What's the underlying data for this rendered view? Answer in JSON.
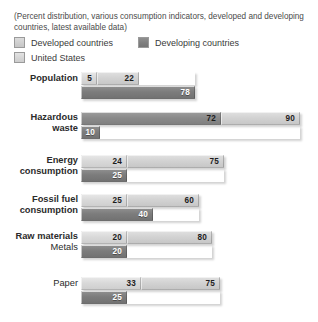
{
  "caption": "(Percent distribution, various consumption indicators, developed and developing countries, latest available data)",
  "legend": {
    "items": [
      {
        "label": "Developed countries",
        "swatch": "light-gray-swatch"
      },
      {
        "label": "Developing countries",
        "swatch": "dark-gray-swatch"
      },
      {
        "label": "United States",
        "swatch": "lightest-gray-swatch"
      }
    ]
  },
  "colors": {
    "developed": "#d2d2d2",
    "developing": "#7c7c7c",
    "united_states": "#d9d9d9",
    "dark_segment": "#8a8a8a",
    "background": "#ffffff",
    "text": "#2b2b2b"
  },
  "chart_data": {
    "type": "bar",
    "title": "(Percent distribution, various consumption indicators, developed and developing countries, latest available data)",
    "xlabel": "",
    "ylabel": "",
    "orientation": "horizontal",
    "grid": false,
    "legend_position": "top",
    "categories": [
      "Population",
      "Hazardous waste",
      "Energy consumption",
      "Fossil fuel consumption",
      "Raw materials / Metals",
      "Paper"
    ],
    "series": [
      {
        "name": "United States",
        "values": [
          5,
          72,
          24,
          25,
          20,
          33
        ]
      },
      {
        "name": "Developed countries",
        "values": [
          22,
          90,
          75,
          60,
          80,
          75
        ]
      },
      {
        "name": "Developing countries",
        "values": [
          78,
          10,
          25,
          40,
          20,
          25
        ]
      }
    ],
    "rows": [
      {
        "label_lines": [
          {
            "text": "Population",
            "bold": true
          }
        ],
        "top_bar": [
          {
            "series": "United States",
            "value": "5",
            "width_px": 16,
            "tone": "us",
            "text": "dark"
          },
          {
            "series": "Developed countries",
            "value": "22",
            "width_px": 42,
            "tone": "developed",
            "text": "dark"
          }
        ],
        "bottom_bar": [
          {
            "series": "Developing countries",
            "value": "78",
            "width_px": 114,
            "tone": "developing",
            "text": "light"
          }
        ]
      },
      {
        "label_lines": [
          {
            "text": "Hazardous",
            "bold": true
          },
          {
            "text": "waste",
            "bold": true
          }
        ],
        "top_bar": [
          {
            "series": "United States",
            "value": "72",
            "width_px": 140,
            "tone": "dark",
            "text": "dark"
          },
          {
            "series": "Developed countries",
            "value": "90",
            "width_px": 79,
            "tone": "developed",
            "text": "dark"
          }
        ],
        "bottom_bar": [
          {
            "series": "Developing countries",
            "value": "10",
            "width_px": 19,
            "tone": "developing",
            "text": "light"
          }
        ]
      },
      {
        "label_lines": [
          {
            "text": "Energy",
            "bold": true
          },
          {
            "text": "consumption",
            "bold": true
          }
        ],
        "top_bar": [
          {
            "series": "United States",
            "value": "24",
            "width_px": 46,
            "tone": "us",
            "text": "dark"
          },
          {
            "series": "Developed countries",
            "value": "75",
            "width_px": 97,
            "tone": "developed",
            "text": "dark"
          }
        ],
        "bottom_bar": [
          {
            "series": "Developing countries",
            "value": "25",
            "width_px": 46,
            "tone": "developing",
            "text": "light"
          }
        ]
      },
      {
        "label_lines": [
          {
            "text": "Fossil fuel",
            "bold": true
          },
          {
            "text": "consumption",
            "bold": true
          }
        ],
        "top_bar": [
          {
            "series": "United States",
            "value": "25",
            "width_px": 46,
            "tone": "us",
            "text": "dark"
          },
          {
            "series": "Developed countries",
            "value": "60",
            "width_px": 72,
            "tone": "developed",
            "text": "dark"
          }
        ],
        "bottom_bar": [
          {
            "series": "Developing countries",
            "value": "40",
            "width_px": 72,
            "tone": "developing",
            "text": "light"
          }
        ]
      },
      {
        "label_lines": [
          {
            "text": "Raw materials",
            "bold": true
          },
          {
            "text": "Metals",
            "bold": false
          }
        ],
        "top_bar": [
          {
            "series": "United States",
            "value": "20",
            "width_px": 46,
            "tone": "us",
            "text": "dark"
          },
          {
            "series": "Developed countries",
            "value": "80",
            "width_px": 85,
            "tone": "developed",
            "text": "dark"
          }
        ],
        "bottom_bar": [
          {
            "series": "Developing countries",
            "value": "20",
            "width_px": 46,
            "tone": "developing",
            "text": "light"
          }
        ]
      },
      {
        "label_lines": [
          {
            "text": "Paper",
            "bold": false
          }
        ],
        "top_bar": [
          {
            "series": "United States",
            "value": "33",
            "width_px": 60,
            "tone": "us",
            "text": "dark"
          },
          {
            "series": "Developed countries",
            "value": "75",
            "width_px": 79,
            "tone": "developed",
            "text": "dark"
          }
        ],
        "bottom_bar": [
          {
            "series": "Developing countries",
            "value": "25",
            "width_px": 46,
            "tone": "developing",
            "text": "light"
          }
        ]
      }
    ]
  },
  "layout": {
    "row_tops": [
      72,
      112,
      155,
      194,
      231,
      277
    ],
    "bar_left_px": 81
  }
}
